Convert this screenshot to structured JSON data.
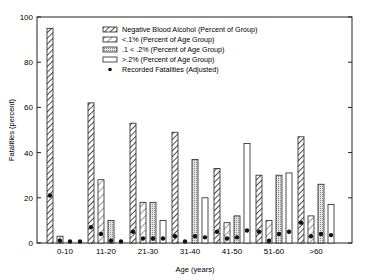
{
  "chart_data": {
    "type": "bar",
    "title": "",
    "xlabel": "Age (years)",
    "ylabel": "Fatalities (percent)",
    "ylim": [
      0,
      100
    ],
    "yticks": [
      0,
      20,
      40,
      60,
      80,
      100
    ],
    "grid": false,
    "legend_position": "upper right (inside)",
    "categories": [
      "0-10",
      "11-20",
      "21-30",
      "31-40",
      "41-50",
      "51-60",
      ">60"
    ],
    "series": [
      {
        "name": "Negative Blood Alcohol (Percent of Group)",
        "pattern": "dense-hatch",
        "values": [
          95,
          62,
          53,
          49,
          33,
          30,
          47
        ]
      },
      {
        "name": "<.1%   (Percent of Age Group)",
        "pattern": "hatch",
        "values": [
          3,
          28,
          18,
          0,
          9,
          10,
          12
        ]
      },
      {
        "name": ".1 < .2%  (Percent of Age Group)",
        "pattern": "stipple",
        "values": [
          0,
          10,
          18,
          37,
          12,
          30,
          26
        ]
      },
      {
        "name": ">.2%   (Percent of Age Group)",
        "pattern": "open",
        "values": [
          0,
          0,
          10,
          20,
          44,
          31,
          17
        ]
      }
    ],
    "markers": {
      "name": "Recorded Fatalities (Adjusted)",
      "values": [
        [
          21,
          1,
          0.5,
          0.5
        ],
        [
          7,
          4,
          1,
          0
        ],
        [
          5,
          2,
          2,
          2
        ],
        [
          3,
          0,
          3,
          2.5
        ],
        [
          5,
          2,
          2.5,
          5.5
        ],
        [
          5,
          1,
          4,
          5
        ],
        [
          9,
          3,
          4,
          3.5
        ]
      ]
    }
  },
  "legend": {
    "items": [
      "Negative Blood Alcohol (Percent of Group)",
      "<.1%   (Percent of Age Group)",
      ".1 < .2%  (Percent of Age Group)",
      ">.2%   (Percent of Age Group)",
      "Recorded Fatalities (Adjusted)"
    ]
  },
  "axes": {
    "xlabel": "Age (years)",
    "ylabel": "Fatalities (percent)"
  }
}
